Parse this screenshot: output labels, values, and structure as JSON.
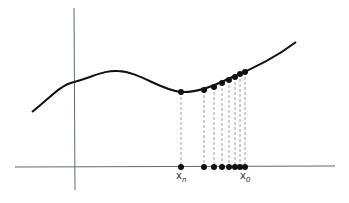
{
  "diagram": {
    "colors": {
      "curve": "#111111",
      "axis": "#5a6a7a",
      "dash": "#888888",
      "point": "#111111"
    },
    "labels": {
      "xn": {
        "base": "x",
        "sub": "n"
      },
      "x0": {
        "base": "x",
        "sub": "0"
      }
    },
    "points_x": [
      181,
      204,
      214,
      222,
      229,
      235,
      240,
      245
    ],
    "points_y": [
      92,
      90,
      87,
      83,
      80,
      77,
      74,
      72
    ],
    "axis_y": 167
  }
}
